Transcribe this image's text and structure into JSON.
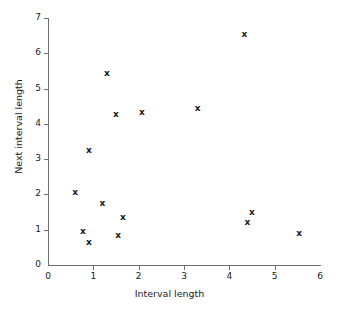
{
  "chart_data": {
    "type": "scatter",
    "title": "",
    "xlabel": "Interval length",
    "ylabel": "Next interval length",
    "xlim": [
      0,
      6
    ],
    "ylim": [
      0,
      7
    ],
    "xticks": [
      0,
      1,
      2,
      3,
      4,
      5,
      6
    ],
    "yticks": [
      0,
      1,
      2,
      3,
      4,
      5,
      6,
      7
    ],
    "xtick_labels": [
      "0",
      "1",
      "2",
      "3",
      "4",
      "5",
      "6"
    ],
    "ytick_labels": [
      "0",
      "1",
      "2",
      "3",
      "4",
      "5",
      "6",
      "7"
    ],
    "grid": false,
    "legend": null,
    "marker": "x",
    "marker_color": "#1a1a1a",
    "axis_color": "#6f6f6f",
    "points": [
      {
        "x": 0.6,
        "y": 2.07
      },
      {
        "x": 0.77,
        "y": 0.96
      },
      {
        "x": 0.9,
        "y": 3.25
      },
      {
        "x": 0.9,
        "y": 0.65
      },
      {
        "x": 1.2,
        "y": 1.75
      },
      {
        "x": 1.3,
        "y": 5.45
      },
      {
        "x": 1.5,
        "y": 4.28
      },
      {
        "x": 1.55,
        "y": 0.85
      },
      {
        "x": 1.65,
        "y": 1.36
      },
      {
        "x": 2.07,
        "y": 4.33
      },
      {
        "x": 3.3,
        "y": 4.45
      },
      {
        "x": 4.33,
        "y": 6.54
      },
      {
        "x": 4.4,
        "y": 1.22
      },
      {
        "x": 4.5,
        "y": 1.5
      },
      {
        "x": 5.54,
        "y": 0.91
      }
    ]
  }
}
